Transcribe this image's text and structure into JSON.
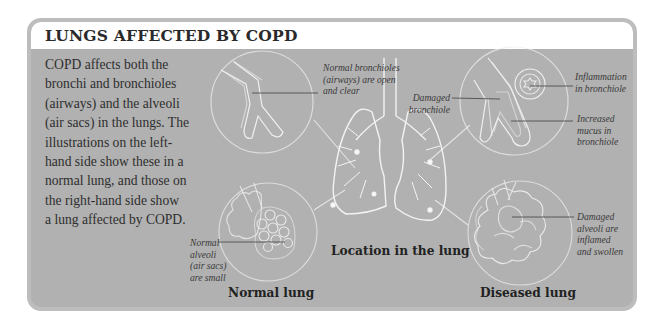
{
  "panel": {
    "title": "LUNGS AFFECTED BY COPD",
    "intro_lines": [
      "COPD affects both the",
      "bronchi and bronchioles",
      "(airways) and the alveoli",
      "(air sacs) in the lungs. The",
      "illustrations on the left-",
      "hand side show these in a",
      "normal lung, and those on",
      "the right-hand side show",
      "a lung affected by COPD."
    ],
    "colors": {
      "frame_border": "#bdbdbd",
      "body_background": "#b1b1b1",
      "header_background": "#ffffff",
      "illustration_line": "#f2f2f2",
      "leader_line": "#555555",
      "text": "#2e2e2e"
    }
  },
  "illustrations": {
    "normal_bronchiole": {
      "icon": "bronchiole-normal-icon",
      "label_lines": [
        "Normal bronchioles",
        "(airways) are open",
        "and clear"
      ]
    },
    "normal_alveoli": {
      "icon": "alveoli-normal-icon",
      "label_lines": [
        "Normal",
        "alveoli",
        "(air sacs)",
        "are small"
      ]
    },
    "lungs": {
      "icon": "lungs-icon",
      "caption": "Location in the lung"
    },
    "damaged_bronchiole": {
      "icon": "bronchiole-damaged-icon",
      "label_lines": [
        "Damaged",
        "bronchiole"
      ]
    },
    "inflammation": {
      "icon": "bronchiole-cross-section-icon",
      "label_lines": [
        "Inflammation",
        "in bronchiole"
      ]
    },
    "mucus": {
      "label_lines": [
        "Increased",
        "mucus in",
        "bronchiole"
      ]
    },
    "damaged_alveoli": {
      "icon": "alveoli-damaged-icon",
      "label_lines": [
        "Damaged",
        "alveoli are",
        "inflamed",
        "and swollen"
      ]
    }
  },
  "captions": {
    "normal": "Normal lung",
    "diseased": "Diseased lung"
  }
}
